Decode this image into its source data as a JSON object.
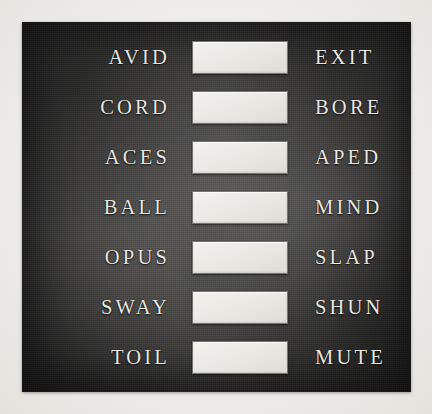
{
  "panel": {
    "background_color": "#3b3a39",
    "surface_label": "slate-panel"
  },
  "page": {
    "background_color": "#f2f1ee"
  },
  "text_color": "#e9e7e1",
  "box_fill_color": "#e9e7e2",
  "rows": [
    {
      "left_word": "AVID",
      "answer": "",
      "placeholder": "",
      "right_word": "EXIT"
    },
    {
      "left_word": "CORD",
      "answer": "",
      "placeholder": "",
      "right_word": "BORE"
    },
    {
      "left_word": "ACES",
      "answer": "",
      "placeholder": "",
      "right_word": "APED"
    },
    {
      "left_word": "BALL",
      "answer": "",
      "placeholder": "",
      "right_word": "MIND"
    },
    {
      "left_word": "OPUS",
      "answer": "",
      "placeholder": "",
      "right_word": "SLAP"
    },
    {
      "left_word": "SWAY",
      "answer": "",
      "placeholder": "",
      "right_word": "SHUN"
    },
    {
      "left_word": "TOIL",
      "answer": "",
      "placeholder": "",
      "right_word": "MUTE"
    }
  ]
}
